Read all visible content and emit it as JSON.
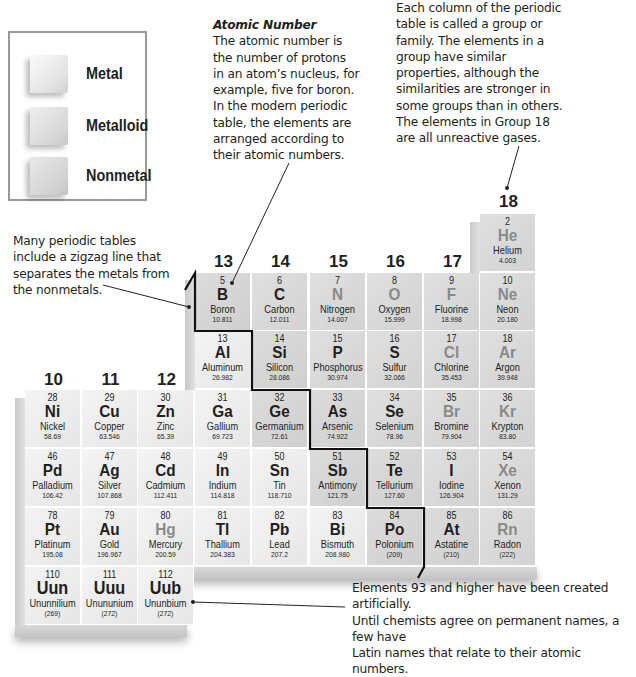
{
  "legend": {
    "items": [
      {
        "label": "Metal",
        "kind": "metal"
      },
      {
        "label": "Metalloid",
        "kind": "metalloid"
      },
      {
        "label": "Nonmetal",
        "kind": "nonmetal"
      }
    ]
  },
  "captions": {
    "atomic_number": {
      "title": "Atomic Number",
      "lines": [
        "The atomic number is",
        "the number of protons",
        "in an atom’s nucleus, for",
        "example, five for boron.",
        "In the modern periodic",
        "table, the elements are",
        "arranged according to",
        "their atomic numbers."
      ]
    },
    "group": {
      "lines": [
        "Each column of the periodic",
        "table is called a group or",
        "family. The elements in a",
        "group have similar",
        "properties, although the",
        "similarities are stronger in",
        "some groups than in others.",
        "The elements in Group 18",
        "are all unreactive gases."
      ]
    },
    "zigzag": {
      "lines": [
        "Many periodic tables",
        "include a zigzag line that",
        "separates the metals from",
        "the nonmetals."
      ]
    },
    "artificial": {
      "lines": [
        "Elements 93 and higher have been created artificially.",
        "Until chemists agree on permanent names, a few have",
        "Latin names that relate to their atomic numbers."
      ]
    }
  },
  "groups": [
    "10",
    "11",
    "12",
    "13",
    "14",
    "15",
    "16",
    "17",
    "18"
  ],
  "elements": [
    {
      "n": "2",
      "sym": "He",
      "name": "Helium",
      "mass": "4.003",
      "col": 8,
      "row": 0,
      "kind": "nonmetal",
      "gas": true
    },
    {
      "n": "5",
      "sym": "B",
      "name": "Boron",
      "mass": "10.811",
      "col": 3,
      "row": 1,
      "kind": "metalloid",
      "gas": false
    },
    {
      "n": "6",
      "sym": "C",
      "name": "Carbon",
      "mass": "12.011",
      "col": 4,
      "row": 1,
      "kind": "nonmetal",
      "gas": false
    },
    {
      "n": "7",
      "sym": "N",
      "name": "Nitrogen",
      "mass": "14.007",
      "col": 5,
      "row": 1,
      "kind": "nonmetal",
      "gas": true
    },
    {
      "n": "8",
      "sym": "O",
      "name": "Oxygen",
      "mass": "15.999",
      "col": 6,
      "row": 1,
      "kind": "nonmetal",
      "gas": true
    },
    {
      "n": "9",
      "sym": "F",
      "name": "Fluorine",
      "mass": "18.998",
      "col": 7,
      "row": 1,
      "kind": "nonmetal",
      "gas": true
    },
    {
      "n": "10",
      "sym": "Ne",
      "name": "Neon",
      "mass": "20.180",
      "col": 8,
      "row": 1,
      "kind": "nonmetal",
      "gas": true
    },
    {
      "n": "13",
      "sym": "Al",
      "name": "Aluminum",
      "mass": "26.982",
      "col": 3,
      "row": 2,
      "kind": "metal",
      "gas": false
    },
    {
      "n": "14",
      "sym": "Si",
      "name": "Silicon",
      "mass": "28.086",
      "col": 4,
      "row": 2,
      "kind": "metalloid",
      "gas": false
    },
    {
      "n": "15",
      "sym": "P",
      "name": "Phosphorus",
      "mass": "30.974",
      "col": 5,
      "row": 2,
      "kind": "nonmetal",
      "gas": false
    },
    {
      "n": "16",
      "sym": "S",
      "name": "Sulfur",
      "mass": "32.066",
      "col": 6,
      "row": 2,
      "kind": "nonmetal",
      "gas": false
    },
    {
      "n": "17",
      "sym": "Cl",
      "name": "Chlorine",
      "mass": "35.453",
      "col": 7,
      "row": 2,
      "kind": "nonmetal",
      "gas": true
    },
    {
      "n": "18",
      "sym": "Ar",
      "name": "Argon",
      "mass": "39.948",
      "col": 8,
      "row": 2,
      "kind": "nonmetal",
      "gas": true
    },
    {
      "n": "28",
      "sym": "Ni",
      "name": "Nickel",
      "mass": "58.69",
      "col": 0,
      "row": 3,
      "kind": "metal",
      "gas": false
    },
    {
      "n": "29",
      "sym": "Cu",
      "name": "Copper",
      "mass": "63.546",
      "col": 1,
      "row": 3,
      "kind": "metal",
      "gas": false
    },
    {
      "n": "30",
      "sym": "Zn",
      "name": "Zinc",
      "mass": "65.39",
      "col": 2,
      "row": 3,
      "kind": "metal",
      "gas": false
    },
    {
      "n": "31",
      "sym": "Ga",
      "name": "Gallium",
      "mass": "69.723",
      "col": 3,
      "row": 3,
      "kind": "metal",
      "gas": false
    },
    {
      "n": "32",
      "sym": "Ge",
      "name": "Germanium",
      "mass": "72.61",
      "col": 4,
      "row": 3,
      "kind": "metalloid",
      "gas": false
    },
    {
      "n": "33",
      "sym": "As",
      "name": "Arsenic",
      "mass": "74.922",
      "col": 5,
      "row": 3,
      "kind": "metalloid",
      "gas": false
    },
    {
      "n": "34",
      "sym": "Se",
      "name": "Selenium",
      "mass": "78.96",
      "col": 6,
      "row": 3,
      "kind": "nonmetal",
      "gas": false
    },
    {
      "n": "35",
      "sym": "Br",
      "name": "Bromine",
      "mass": "79.904",
      "col": 7,
      "row": 3,
      "kind": "nonmetal",
      "gas": true
    },
    {
      "n": "36",
      "sym": "Kr",
      "name": "Krypton",
      "mass": "83.80",
      "col": 8,
      "row": 3,
      "kind": "nonmetal",
      "gas": true
    },
    {
      "n": "46",
      "sym": "Pd",
      "name": "Palladium",
      "mass": "106.42",
      "col": 0,
      "row": 4,
      "kind": "metal",
      "gas": false
    },
    {
      "n": "47",
      "sym": "Ag",
      "name": "Silver",
      "mass": "107.868",
      "col": 1,
      "row": 4,
      "kind": "metal",
      "gas": false
    },
    {
      "n": "48",
      "sym": "Cd",
      "name": "Cadmium",
      "mass": "112.411",
      "col": 2,
      "row": 4,
      "kind": "metal",
      "gas": false
    },
    {
      "n": "49",
      "sym": "In",
      "name": "Indium",
      "mass": "114.818",
      "col": 3,
      "row": 4,
      "kind": "metal",
      "gas": false
    },
    {
      "n": "50",
      "sym": "Sn",
      "name": "Tin",
      "mass": "118.710",
      "col": 4,
      "row": 4,
      "kind": "metal",
      "gas": false
    },
    {
      "n": "51",
      "sym": "Sb",
      "name": "Antimony",
      "mass": "121.75",
      "col": 5,
      "row": 4,
      "kind": "metalloid",
      "gas": false
    },
    {
      "n": "52",
      "sym": "Te",
      "name": "Tellurium",
      "mass": "127.60",
      "col": 6,
      "row": 4,
      "kind": "metalloid",
      "gas": false
    },
    {
      "n": "53",
      "sym": "I",
      "name": "Iodine",
      "mass": "126.904",
      "col": 7,
      "row": 4,
      "kind": "nonmetal",
      "gas": false
    },
    {
      "n": "54",
      "sym": "Xe",
      "name": "Xenon",
      "mass": "131.29",
      "col": 8,
      "row": 4,
      "kind": "nonmetal",
      "gas": true
    },
    {
      "n": "78",
      "sym": "Pt",
      "name": "Platinum",
      "mass": "195.08",
      "col": 0,
      "row": 5,
      "kind": "metal",
      "gas": false
    },
    {
      "n": "79",
      "sym": "Au",
      "name": "Gold",
      "mass": "196.967",
      "col": 1,
      "row": 5,
      "kind": "metal",
      "gas": false
    },
    {
      "n": "80",
      "sym": "Hg",
      "name": "Mercury",
      "mass": "200.59",
      "col": 2,
      "row": 5,
      "kind": "metal",
      "gas": true
    },
    {
      "n": "81",
      "sym": "Tl",
      "name": "Thallium",
      "mass": "204.383",
      "col": 3,
      "row": 5,
      "kind": "metal",
      "gas": false
    },
    {
      "n": "82",
      "sym": "Pb",
      "name": "Lead",
      "mass": "207.2",
      "col": 4,
      "row": 5,
      "kind": "metal",
      "gas": false
    },
    {
      "n": "83",
      "sym": "Bi",
      "name": "Bismuth",
      "mass": "208.980",
      "col": 5,
      "row": 5,
      "kind": "metal",
      "gas": false
    },
    {
      "n": "84",
      "sym": "Po",
      "name": "Polonium",
      "mass": "(209)",
      "col": 6,
      "row": 5,
      "kind": "metalloid",
      "gas": false
    },
    {
      "n": "85",
      "sym": "At",
      "name": "Astatine",
      "mass": "(210)",
      "col": 7,
      "row": 5,
      "kind": "metalloid",
      "gas": false
    },
    {
      "n": "86",
      "sym": "Rn",
      "name": "Radon",
      "mass": "(222)",
      "col": 8,
      "row": 5,
      "kind": "nonmetal",
      "gas": true
    },
    {
      "n": "110",
      "sym": "Uun",
      "name": "Ununnilium",
      "mass": "(269)",
      "col": 0,
      "row": 6,
      "kind": "metal",
      "gas": false
    },
    {
      "n": "111",
      "sym": "Uuu",
      "name": "Unununium",
      "mass": "(272)",
      "col": 1,
      "row": 6,
      "kind": "metal",
      "gas": false
    },
    {
      "n": "112",
      "sym": "Uub",
      "name": "Ununbium",
      "mass": "(272)",
      "col": 2,
      "row": 6,
      "kind": "metal",
      "gas": false
    }
  ]
}
